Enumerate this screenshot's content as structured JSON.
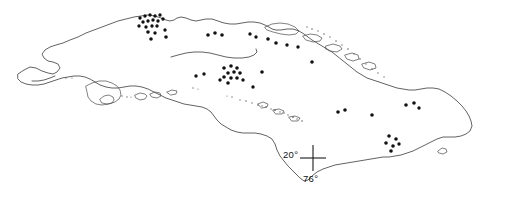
{
  "figure": {
    "name": "cuba-locality-map",
    "width": 518,
    "height": 206,
    "background_color": "#ffffff",
    "outline_color": "#3b3b3b",
    "dot_color": "#111111"
  },
  "graticule": {
    "crosshair": {
      "x": 313,
      "y": 158,
      "arm_length": 13
    },
    "latitude": {
      "label": "20°",
      "value": 20,
      "unit": "degrees north"
    },
    "longitude": {
      "label": "76°",
      "value": 76,
      "unit": "degrees west"
    }
  },
  "chart_data": {
    "type": "scatter",
    "title": "",
    "xlabel": "",
    "ylabel": "",
    "projection_note": "Geographic outline of Cuba; points mark recorded localities",
    "coastline_paths": [
      "M 18,74 L 24,70 L 30,67 L 36,68 L 42,71 L 48,73 L 53,74 L 57,72 L 60,68 L 58,64 L 53,62 L 48,61 L 44,58 L 42,54 L 45,50 L 50,47 L 56,45 L 63,43 L 70,40 L 78,37 L 86,33 L 94,30 L 102,27 L 110,24 L 118,21 L 126,19 L 134,17 L 141,16 L 148,15 L 155,16 L 161,18 L 166,20 L 170,21 L 174,20 L 177,18 L 181,17 L 186,18 L 191,20 L 196,21 L 201,20 L 206,19 L 212,19 L 218,21 L 224,23 L 230,24 L 236,24 L 242,23 L 248,22 L 254,22 L 260,23 L 265,25 L 269,27 L 272,29 L 276,30 L 281,30 L 287,29 L 293,29 L 299,31 L 304,34 L 308,37 L 312,40 L 317,43 L 322,46 L 327,49 L 332,52 L 337,56 L 342,60 L 347,64 L 352,68 L 357,72 L 362,75 L 367,78 L 373,80 L 379,82 L 385,84 L 391,86 L 397,88 L 403,89 L 409,90 L 415,90 L 421,89 L 427,88 L 433,88 L 439,89 L 445,92 L 451,96 L 457,101 L 462,106 L 466,111 L 469,116 L 471,121 L 472,126 L 470,131 L 466,134 L 461,136 L 455,137 L 449,137 L 443,137 L 437,139 L 431,142 L 425,145 L 419,148 L 413,151 L 407,153 L 401,155 L 395,156 L 389,157 L 383,157 L 377,158 L 371,159 L 365,160 L 359,161 L 353,162 L 347,163 L 341,164 L 335,165 L 329,167 L 323,169 L 317,172 L 312,176 L 308,180 L 304,181 L 300,178 L 296,174 L 292,170 L 288,166 L 284,161 L 280,156 L 277,150 L 275,144 L 272,139 L 267,136 L 261,134 L 255,133 L 249,133 L 243,133 L 237,132 L 231,130 L 226,127 L 221,124 L 217,120 L 214,116 L 211,112 L 207,109 L 202,107 L 196,106 L 190,105 L 184,104 L 178,102 L 172,100 L 166,98 L 160,95 L 154,92 L 148,89 L 142,87 L 136,86 L 130,86 L 124,87 L 118,88 L 112,88 L 106,87 L 100,85 L 95,82 L 90,79 L 85,77 L 80,76 L 74,76 L 68,77 L 62,78 L 56,80 L 50,82 L 44,84 L 38,85 L 32,85 L 26,84 L 21,82 L 18,79 Z",
      "M 171,57 L 178,55 L 186,53 L 194,52 L 202,52 L 210,53 L 218,55 L 226,57 L 234,58 L 242,58 L 249,57 L 254,55 L 257,52 L 256,49",
      "M 55,76 L 50,78 L 44,80 L 38,81 L 32,81"
    ],
    "key_outline_paths": [
      "M 86,86 L 92,83 L 99,81 L 106,81 L 112,83 L 117,86 L 120,90 L 121,95 L 119,99 L 115,102 L 109,104 L 102,105 L 96,104 L 91,101 L 88,97 L 87,92 Z",
      "M 100,99 L 104,96 L 109,95 L 113,97 L 114,100 L 112,103 L 107,104 L 102,103 Z",
      "M 135,95 L 140,93 L 145,94 L 147,96 L 145,99 L 140,100 L 136,98 Z",
      "M 150,94 L 155,92 L 160,93 L 161,96 L 157,98 L 152,97 Z",
      "M 167,92 L 172,90 L 177,91 L 176,94 L 171,95 Z",
      "M 265,27 L 272,24 L 280,23 L 288,24 L 295,27 L 299,31 L 296,34 L 289,35 L 281,34 L 273,32 L 267,30 Z",
      "M 303,36 L 310,34 L 317,35 L 322,38 L 320,41 L 313,42 L 306,40 Z",
      "M 326,46 L 333,44 L 340,46 L 342,49 L 337,52 L 330,51 L 326,49 Z",
      "M 345,55 L 352,53 L 358,55 L 359,59 L 353,61 L 347,59 Z",
      "M 362,64 L 369,62 L 375,64 L 376,68 L 370,70 L 364,68 Z",
      "M 438,151 L 442,148 L 446,149 L 447,152 L 443,154 L 439,153 Z",
      "M 258,104 L 263,102 L 268,104 L 267,107 L 262,108 Z",
      "M 273,110 L 279,109 L 284,111 L 282,114 L 276,114 Z",
      "M 289,117 L 295,116 L 300,118 L 298,121 L 292,121 Z"
    ],
    "key_specks": [
      {
        "x": 258,
        "y": 105,
        "r": 0.8
      },
      {
        "x": 262,
        "y": 106,
        "r": 0.7
      },
      {
        "x": 266,
        "y": 107,
        "r": 0.8
      },
      {
        "x": 271,
        "y": 109,
        "r": 0.7
      },
      {
        "x": 275,
        "y": 110,
        "r": 0.9
      },
      {
        "x": 280,
        "y": 112,
        "r": 0.7
      },
      {
        "x": 284,
        "y": 113,
        "r": 0.8
      },
      {
        "x": 288,
        "y": 115,
        "r": 0.7
      },
      {
        "x": 293,
        "y": 117,
        "r": 0.9
      },
      {
        "x": 297,
        "y": 119,
        "r": 0.7
      },
      {
        "x": 302,
        "y": 121,
        "r": 0.8
      },
      {
        "x": 240,
        "y": 100,
        "r": 0.7
      },
      {
        "x": 246,
        "y": 101,
        "r": 0.8
      },
      {
        "x": 252,
        "y": 103,
        "r": 0.7
      },
      {
        "x": 232,
        "y": 97,
        "r": 0.7
      },
      {
        "x": 227,
        "y": 96,
        "r": 0.6
      },
      {
        "x": 307,
        "y": 27,
        "r": 0.7
      },
      {
        "x": 312,
        "y": 29,
        "r": 0.8
      },
      {
        "x": 318,
        "y": 31,
        "r": 0.7
      },
      {
        "x": 324,
        "y": 34,
        "r": 0.8
      },
      {
        "x": 330,
        "y": 37,
        "r": 0.7
      },
      {
        "x": 336,
        "y": 41,
        "r": 0.8
      },
      {
        "x": 342,
        "y": 45,
        "r": 0.7
      },
      {
        "x": 348,
        "y": 49,
        "r": 0.8
      },
      {
        "x": 354,
        "y": 54,
        "r": 0.7
      },
      {
        "x": 360,
        "y": 59,
        "r": 0.8
      },
      {
        "x": 366,
        "y": 64,
        "r": 0.7
      },
      {
        "x": 372,
        "y": 69,
        "r": 0.8
      },
      {
        "x": 378,
        "y": 73,
        "r": 0.7
      },
      {
        "x": 384,
        "y": 77,
        "r": 0.7
      },
      {
        "x": 122,
        "y": 96,
        "r": 0.7
      },
      {
        "x": 127,
        "y": 97,
        "r": 0.7
      },
      {
        "x": 131,
        "y": 97,
        "r": 0.6
      },
      {
        "x": 66,
        "y": 78,
        "r": 0.7
      },
      {
        "x": 72,
        "y": 78,
        "r": 0.6
      },
      {
        "x": 193,
        "y": 88,
        "r": 0.7
      },
      {
        "x": 198,
        "y": 89,
        "r": 0.6
      }
    ],
    "localities": [
      {
        "x": 140,
        "y": 18,
        "r": 1.7
      },
      {
        "x": 145,
        "y": 16,
        "r": 1.7
      },
      {
        "x": 150,
        "y": 15,
        "r": 1.7
      },
      {
        "x": 155,
        "y": 16,
        "r": 1.7
      },
      {
        "x": 160,
        "y": 15,
        "r": 1.7
      },
      {
        "x": 143,
        "y": 22,
        "r": 1.7
      },
      {
        "x": 148,
        "y": 21,
        "r": 1.7
      },
      {
        "x": 153,
        "y": 20,
        "r": 1.7
      },
      {
        "x": 158,
        "y": 21,
        "r": 1.7
      },
      {
        "x": 163,
        "y": 19,
        "r": 1.7
      },
      {
        "x": 146,
        "y": 27,
        "r": 1.7
      },
      {
        "x": 152,
        "y": 26,
        "r": 1.7
      },
      {
        "x": 157,
        "y": 26,
        "r": 1.7
      },
      {
        "x": 139,
        "y": 26,
        "r": 1.7
      },
      {
        "x": 148,
        "y": 32,
        "r": 1.8
      },
      {
        "x": 155,
        "y": 33,
        "r": 1.7
      },
      {
        "x": 151,
        "y": 39,
        "r": 1.8
      },
      {
        "x": 165,
        "y": 30,
        "r": 1.7
      },
      {
        "x": 166,
        "y": 37,
        "r": 1.8
      },
      {
        "x": 208,
        "y": 35,
        "r": 1.8
      },
      {
        "x": 215,
        "y": 33,
        "r": 1.8
      },
      {
        "x": 222,
        "y": 35,
        "r": 1.8
      },
      {
        "x": 250,
        "y": 34,
        "r": 1.7
      },
      {
        "x": 256,
        "y": 37,
        "r": 1.7
      },
      {
        "x": 268,
        "y": 39,
        "r": 1.8
      },
      {
        "x": 276,
        "y": 43,
        "r": 1.8
      },
      {
        "x": 287,
        "y": 45,
        "r": 1.7
      },
      {
        "x": 298,
        "y": 47,
        "r": 1.7
      },
      {
        "x": 224,
        "y": 68,
        "r": 1.8
      },
      {
        "x": 231,
        "y": 66,
        "r": 1.8
      },
      {
        "x": 237,
        "y": 68,
        "r": 1.8
      },
      {
        "x": 228,
        "y": 73,
        "r": 1.8
      },
      {
        "x": 234,
        "y": 72,
        "r": 1.8
      },
      {
        "x": 240,
        "y": 73,
        "r": 1.8
      },
      {
        "x": 224,
        "y": 77,
        "r": 1.8
      },
      {
        "x": 231,
        "y": 78,
        "r": 1.8
      },
      {
        "x": 237,
        "y": 78,
        "r": 1.8
      },
      {
        "x": 228,
        "y": 83,
        "r": 1.8
      },
      {
        "x": 243,
        "y": 80,
        "r": 1.7
      },
      {
        "x": 220,
        "y": 80,
        "r": 1.7
      },
      {
        "x": 262,
        "y": 72,
        "r": 1.8
      },
      {
        "x": 312,
        "y": 62,
        "r": 1.8
      },
      {
        "x": 196,
        "y": 76,
        "r": 1.7
      },
      {
        "x": 204,
        "y": 74,
        "r": 1.7
      },
      {
        "x": 253,
        "y": 87,
        "r": 1.7
      },
      {
        "x": 338,
        "y": 112,
        "r": 1.8
      },
      {
        "x": 345,
        "y": 110,
        "r": 1.8
      },
      {
        "x": 372,
        "y": 115,
        "r": 1.8
      },
      {
        "x": 406,
        "y": 105,
        "r": 1.8
      },
      {
        "x": 414,
        "y": 103,
        "r": 1.8
      },
      {
        "x": 419,
        "y": 108,
        "r": 1.7
      },
      {
        "x": 389,
        "y": 136,
        "r": 1.8
      },
      {
        "x": 396,
        "y": 139,
        "r": 1.8
      },
      {
        "x": 386,
        "y": 143,
        "r": 1.8
      },
      {
        "x": 393,
        "y": 146,
        "r": 1.8
      },
      {
        "x": 399,
        "y": 144,
        "r": 1.7
      },
      {
        "x": 391,
        "y": 151,
        "r": 1.8
      }
    ]
  }
}
